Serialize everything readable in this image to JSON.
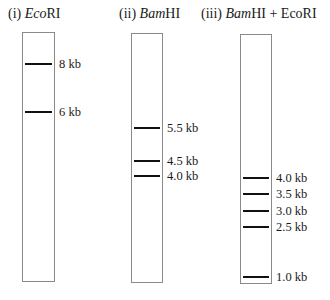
{
  "lanes": [
    {
      "title_prefix": "(i) ",
      "title_italic": "Eco",
      "title_suffix": "RI",
      "title_x": 8,
      "box": {
        "x": 22,
        "y": 32,
        "w": 33,
        "h": 250
      },
      "bands": [
        {
          "label": "8 kb",
          "size_kb": 8,
          "y": 64
        },
        {
          "label": "6 kb",
          "size_kb": 6,
          "y": 112
        }
      ]
    },
    {
      "title_prefix": "(ii) ",
      "title_italic": "Bam",
      "title_suffix": "HI",
      "title_x": 119,
      "box": {
        "x": 131,
        "y": 33,
        "w": 32,
        "h": 250
      },
      "bands": [
        {
          "label": "5.5 kb",
          "size_kb": 5.5,
          "y": 128
        },
        {
          "label": "4.5 kb",
          "size_kb": 4.5,
          "y": 161
        },
        {
          "label": "4.0 kb",
          "size_kb": 4.0,
          "y": 176
        }
      ]
    },
    {
      "title_prefix": "(iii) ",
      "title_italic": "Bam",
      "title_suffix": "HI + EcoRI",
      "title_x": 201,
      "box": {
        "x": 240,
        "y": 34,
        "w": 32,
        "h": 250
      },
      "bands": [
        {
          "label": "4.0 kb",
          "size_kb": 4.0,
          "y": 178
        },
        {
          "label": "3.5 kb",
          "size_kb": 3.5,
          "y": 194
        },
        {
          "label": "3.0 kb",
          "size_kb": 3.0,
          "y": 211
        },
        {
          "label": "2.5 kb",
          "size_kb": 2.5,
          "y": 227
        },
        {
          "label": "1.0 kb",
          "size_kb": 1.0,
          "y": 277
        }
      ]
    }
  ]
}
